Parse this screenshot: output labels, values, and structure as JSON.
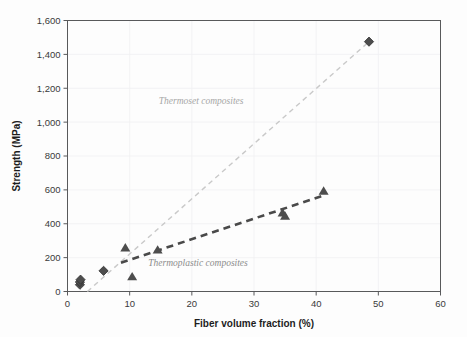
{
  "chart_data": {
    "type": "scatter",
    "title": "",
    "xlabel": "Fiber volume fraction (%)",
    "ylabel": "Strength (MPa)",
    "xlim": [
      0,
      60
    ],
    "ylim": [
      0,
      1600
    ],
    "xticks": [
      "0",
      "10",
      "20",
      "30",
      "40",
      "50",
      "60"
    ],
    "xtick_values": [
      0,
      10,
      20,
      30,
      40,
      50,
      60
    ],
    "yticks": [
      "0",
      "200",
      "400",
      "600",
      "800",
      "1,000",
      "1,200",
      "1,400",
      "1,600"
    ],
    "ytick_values": [
      0,
      200,
      400,
      600,
      800,
      1000,
      1200,
      1400,
      1600
    ],
    "grid": true,
    "legend": "annotations-inline",
    "series": [
      {
        "name": "Thermoset composites",
        "marker": "diamond",
        "color": "#4d4d4d",
        "trendline_color": "#c9c9c9",
        "trendline_style": "dashed",
        "points": [
          {
            "x": 2.0,
            "y": 40
          },
          {
            "x": 2.0,
            "y": 56
          },
          {
            "x": 2.1,
            "y": 70
          },
          {
            "x": 5.8,
            "y": 122
          },
          {
            "x": 48.5,
            "y": 1475
          }
        ],
        "trendline": [
          {
            "x": 3.2,
            "y": 0
          },
          {
            "x": 48.5,
            "y": 1475
          }
        ]
      },
      {
        "name": "Thermoplastic composites",
        "marker": "triangle",
        "color": "#4d4d4d",
        "trendline_color": "#4a4a4a",
        "trendline_style": "dashed",
        "points": [
          {
            "x": 9.3,
            "y": 255
          },
          {
            "x": 10.4,
            "y": 85
          },
          {
            "x": 14.5,
            "y": 243
          },
          {
            "x": 34.6,
            "y": 462
          },
          {
            "x": 35.0,
            "y": 443
          },
          {
            "x": 41.2,
            "y": 590
          }
        ],
        "trendline": [
          {
            "x": 8.6,
            "y": 170
          },
          {
            "x": 41.3,
            "y": 568
          }
        ]
      }
    ],
    "annotations": [
      {
        "text": "Thermoset composites",
        "x": 21.5,
        "y": 1105,
        "color": "#a6a6a6"
      },
      {
        "text": "Thermoplastic composites",
        "x": 21.0,
        "y": 150,
        "color": "#8c8c8c"
      }
    ]
  }
}
